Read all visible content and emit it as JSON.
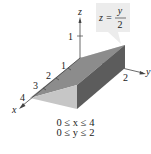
{
  "figure": {
    "equation": {
      "lhs": "z =",
      "numerator": "y",
      "denominator": "2"
    },
    "axes": {
      "x_label": "x",
      "y_label": "y",
      "z_label": "z",
      "x_ticks": [
        "1",
        "2",
        "3",
        "4"
      ],
      "y_ticks": [
        "2"
      ],
      "z_ticks": [
        "1"
      ]
    },
    "conditions": [
      "0 ≤ x ≤ 4",
      "0 ≤ y ≤ 2"
    ],
    "colors": {
      "top_face": "#8c8c8c",
      "side_face": "#5c5c5c",
      "front_face": "#c6c6c6",
      "back_face": "#d4d4d4",
      "label_box": "#ececec"
    }
  }
}
